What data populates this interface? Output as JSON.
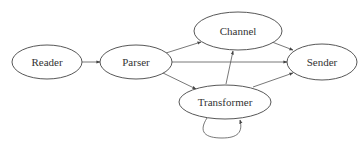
{
  "diagram": {
    "type": "directed-graph",
    "nodes": [
      {
        "id": "reader",
        "label": "Reader"
      },
      {
        "id": "parser",
        "label": "Parser"
      },
      {
        "id": "channel",
        "label": "Channel"
      },
      {
        "id": "sender",
        "label": "Sender"
      },
      {
        "id": "transformer",
        "label": "Transformer"
      }
    ],
    "edges": [
      {
        "from": "Reader",
        "to": "Parser"
      },
      {
        "from": "Parser",
        "to": "Channel"
      },
      {
        "from": "Parser",
        "to": "Sender"
      },
      {
        "from": "Parser",
        "to": "Transformer"
      },
      {
        "from": "Channel",
        "to": "Sender"
      },
      {
        "from": "Transformer",
        "to": "Channel"
      },
      {
        "from": "Transformer",
        "to": "Sender"
      },
      {
        "from": "Transformer",
        "to": "Transformer"
      }
    ],
    "colors": {
      "stroke": "#444444",
      "text": "#333333",
      "background": "#ffffff"
    }
  }
}
